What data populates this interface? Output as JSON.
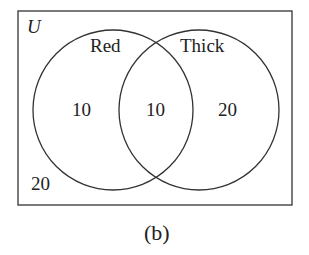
{
  "diagram": {
    "type": "venn",
    "universe_label": "U",
    "sets": [
      {
        "name": "Red",
        "only_count": "10"
      },
      {
        "name": "Thick",
        "only_count": "20"
      }
    ],
    "intersection_count": "10",
    "outside_count": "20",
    "caption": "(b)"
  },
  "colors": {
    "stroke": "#333333",
    "text": "#222222",
    "background": "#ffffff"
  }
}
